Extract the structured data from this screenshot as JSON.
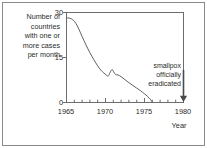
{
  "chart_data": {
    "type": "line",
    "title": "",
    "subtitle": "",
    "xlabel": "Year",
    "ylabel": "Number of countries with one or more cases per month",
    "ylabel_lines": [
      "Number of",
      "countries",
      "with one or",
      "more cases",
      "per month"
    ],
    "xlim": [
      1965,
      1980
    ],
    "ylim": [
      0,
      30
    ],
    "x_ticks": [
      1965,
      1970,
      1975,
      1980
    ],
    "x_tick_labels": [
      "1965",
      "1970",
      "1975",
      "1980"
    ],
    "x_minor_tick_interval": 1,
    "y_ticks": [
      0,
      15,
      30
    ],
    "y_tick_labels": [
      "0",
      "15",
      "30"
    ],
    "grid": false,
    "legend": false,
    "frame": "box",
    "series": [
      {
        "name": "Countries with one or more smallpox cases per month",
        "x": [
          1965.0,
          1965.4,
          1965.8,
          1966.2,
          1966.6,
          1967.0,
          1967.5,
          1968.0,
          1968.5,
          1969.0,
          1969.4,
          1969.8,
          1970.1,
          1970.35,
          1970.6,
          1970.85,
          1971.05,
          1971.3,
          1971.6,
          1972.0,
          1972.5,
          1973.0,
          1973.5,
          1974.0,
          1974.5,
          1975.0,
          1975.4,
          1975.8,
          1976.0
        ],
        "y": [
          28.2,
          28.1,
          27.6,
          26.4,
          24.4,
          22.0,
          19.2,
          16.6,
          14.3,
          12.2,
          10.8,
          9.8,
          9.2,
          8.8,
          10.1,
          11.0,
          10.2,
          9.3,
          9.2,
          8.6,
          7.6,
          6.6,
          5.7,
          4.8,
          3.9,
          2.9,
          2.0,
          0.9,
          0.0
        ]
      }
    ],
    "annotations": [
      {
        "name": "eradication-note",
        "lines": [
          "smallpox",
          "officially",
          "eradicated"
        ],
        "text": "smallpox officially eradicated",
        "points_to_x": 1980,
        "points_to_y": 0,
        "arrow": "down"
      }
    ],
    "colors": {
      "line": "#5f5f5f",
      "axis": "#6d6d6d",
      "text": "#2b2b2b",
      "frame": "#8a8a8a",
      "background": "#ffffff"
    }
  }
}
